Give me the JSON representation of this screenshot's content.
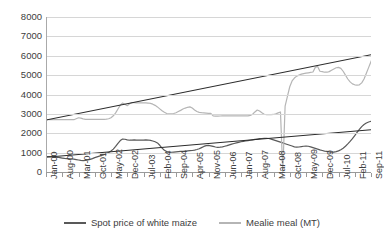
{
  "chart_data": {
    "type": "line",
    "title": "",
    "xlabel": "",
    "ylabel": "",
    "ylim": [
      0,
      8000
    ],
    "ytick_values": [
      0,
      1000,
      2000,
      3000,
      4000,
      5000,
      6000,
      7000,
      8000
    ],
    "ytick_labels": [
      "0",
      "1000",
      "2000",
      "3000",
      "4000",
      "5000",
      "6000",
      "7000",
      "8000"
    ],
    "grid": true,
    "legend_position": "bottom-center",
    "x_tick_labels": [
      "Jan-00",
      "Aug-00",
      "Mar-01",
      "Oct-01",
      "May-02",
      "Dec-02",
      "Jul-03",
      "Feb-04",
      "Sep-04",
      "Apr-05",
      "Nov-05",
      "Jun-06",
      "Jan-07",
      "Aug-07",
      "Mar-08",
      "Oct-08",
      "May-09",
      "Dec-09",
      "Jul-10",
      "Feb-11",
      "Sep-11"
    ],
    "x_tick_step_months": 7,
    "x_start": "Jan-00",
    "x_end": "Sep-11",
    "n_points": 141,
    "series": [
      {
        "name": "Spot price of white maize",
        "color": "#595959",
        "values": [
          800,
          800,
          790,
          780,
          770,
          760,
          740,
          720,
          700,
          690,
          680,
          670,
          660,
          640,
          620,
          600,
          590,
          600,
          620,
          650,
          690,
          740,
          780,
          820,
          860,
          900,
          950,
          1010,
          1080,
          1180,
          1320,
          1480,
          1620,
          1700,
          1690,
          1660,
          1640,
          1650,
          1660,
          1650,
          1640,
          1640,
          1650,
          1660,
          1650,
          1630,
          1600,
          1560,
          1500,
          1380,
          1230,
          1120,
          1060,
          1030,
          1020,
          1030,
          1040,
          1050,
          1060,
          1070,
          1080,
          1090,
          1100,
          1110,
          1130,
          1160,
          1200,
          1260,
          1320,
          1360,
          1370,
          1350,
          1320,
          1290,
          1270,
          1280,
          1300,
          1330,
          1360,
          1400,
          1440,
          1470,
          1500,
          1530,
          1560,
          1580,
          1600,
          1620,
          1640,
          1660,
          1680,
          1700,
          1720,
          1730,
          1740,
          1740,
          1730,
          1700,
          1660,
          1620,
          1580,
          1540,
          1500,
          1460,
          1420,
          1380,
          1340,
          1300,
          1280,
          1290,
          1310,
          1330,
          1340,
          1330,
          1300,
          1260,
          1220,
          1180,
          1140,
          1110,
          1080,
          1060,
          1040,
          1030,
          1030,
          1050,
          1090,
          1150,
          1230,
          1330,
          1450,
          1580,
          1720,
          1880,
          2040,
          2200,
          2340,
          2450,
          2530,
          2580,
          2620,
          2480,
          2560,
          2620,
          2600
        ]
      },
      {
        "name": "Mealie meal (MT)",
        "color": "#b5b5b5",
        "values": [
          2700,
          2700,
          2700,
          2700,
          2700,
          2700,
          2700,
          2700,
          2700,
          2700,
          2700,
          2700,
          2700,
          2750,
          2800,
          2780,
          2740,
          2720,
          2720,
          2720,
          2720,
          2720,
          2720,
          2720,
          2720,
          2720,
          2730,
          2750,
          2800,
          2900,
          3050,
          3250,
          3450,
          3560,
          3500,
          3420,
          3520,
          3580,
          3580,
          3570,
          3570,
          3570,
          3570,
          3570,
          3560,
          3540,
          3500,
          3440,
          3360,
          3260,
          3160,
          3080,
          3020,
          3000,
          3000,
          3020,
          3060,
          3120,
          3180,
          3250,
          3300,
          3340,
          3360,
          3300,
          3200,
          3120,
          3080,
          3060,
          3050,
          3040,
          3030,
          3030,
          2900,
          2880,
          2880,
          2890,
          2900,
          2900,
          2900,
          2900,
          2900,
          2900,
          2900,
          2900,
          2900,
          2900,
          2900,
          2900,
          2920,
          2980,
          3100,
          3200,
          3150,
          3060,
          2980,
          2960,
          2960,
          2960,
          2970,
          3000,
          3050,
          3100,
          40,
          3400,
          3900,
          4400,
          4700,
          4850,
          4950,
          5000,
          5050,
          5080,
          5100,
          5120,
          5140,
          5160,
          5400,
          5450,
          5200,
          5180,
          5150,
          5150,
          5180,
          5250,
          5320,
          5380,
          5400,
          5350,
          5200,
          5000,
          4800,
          4650,
          4550,
          4500,
          4480,
          4500,
          4600,
          4800,
          5100,
          5400,
          5700,
          6000,
          6400,
          6900,
          7500
        ]
      }
    ],
    "trendlines": [
      {
        "name": "Mealie meal trend",
        "color": "#2b2b2b",
        "start_value": 2680,
        "end_value": 6050
      },
      {
        "name": "Spot price trend",
        "color": "#2b2b2b",
        "start_value": 760,
        "end_value": 2180
      }
    ]
  },
  "legend": {
    "items": [
      {
        "label": "Spot price of white maize",
        "color": "#595959"
      },
      {
        "label": "Mealie meal (MT)",
        "color": "#b5b5b5"
      }
    ]
  }
}
